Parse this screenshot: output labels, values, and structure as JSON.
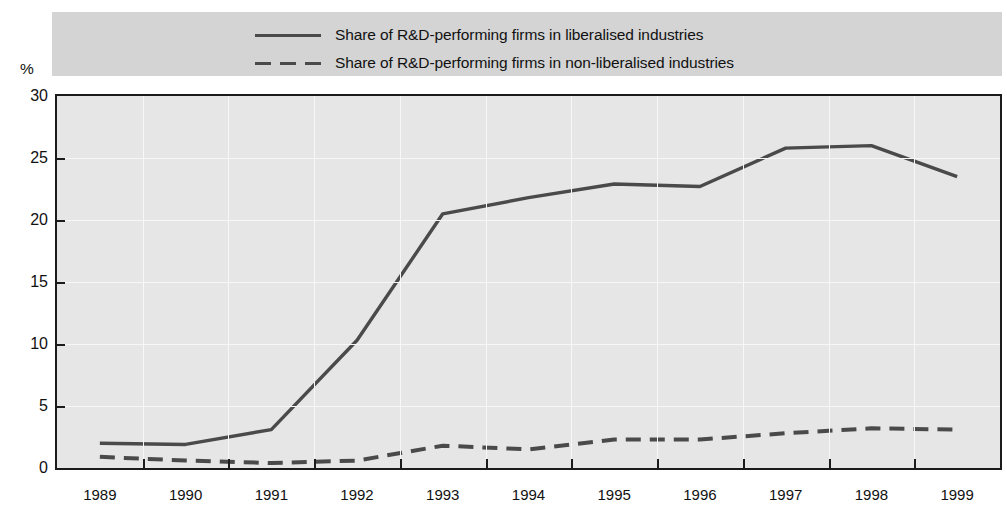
{
  "chart_data": {
    "type": "line",
    "title": "",
    "subtitle": "",
    "xlabel": "",
    "ylabel": "%",
    "unit_label": "%",
    "categories": [
      "1989",
      "1990",
      "1991",
      "1992",
      "1993",
      "1994",
      "1995",
      "1996",
      "1997",
      "1998",
      "1999"
    ],
    "x_tick_labels": [
      "1989",
      "1990",
      "1991",
      "1992",
      "1993",
      "1994",
      "1995",
      "1996",
      "1997",
      "1998",
      "1999"
    ],
    "y_tick_labels": [
      "0",
      "5",
      "10",
      "15",
      "20",
      "25",
      "30"
    ],
    "y_ticks": [
      0,
      5,
      10,
      15,
      20,
      25,
      30
    ],
    "ylim": [
      0,
      30
    ],
    "grid": true,
    "legend_position": "top",
    "series": [
      {
        "name": "Share of R&D-performing firms in liberalised industries",
        "style": "solid",
        "color": "#4a4a4a",
        "values": [
          2.0,
          1.9,
          3.1,
          10.3,
          20.5,
          21.8,
          22.9,
          22.7,
          25.8,
          26.0,
          23.5
        ]
      },
      {
        "name": "Share of R&D-performing firms in non-liberalised industries",
        "style": "dashed",
        "color": "#4a4a4a",
        "values": [
          0.9,
          0.6,
          0.4,
          0.6,
          1.8,
          1.5,
          2.3,
          2.3,
          2.8,
          3.2,
          3.1
        ]
      }
    ]
  },
  "legend": {
    "items": [
      {
        "label": "Share of R&D-performing firms in liberalised industries",
        "style": "solid"
      },
      {
        "label": "Share of R&D-performing firms in non-liberalised industries",
        "style": "dashed"
      }
    ]
  },
  "colors": {
    "line": "#4a4a4a",
    "plot_background": "#e6e6e6",
    "legend_background": "#d4d4d4",
    "axis": "#1b1b1b",
    "gridline": "#f7f7f7",
    "text": "#111111"
  }
}
